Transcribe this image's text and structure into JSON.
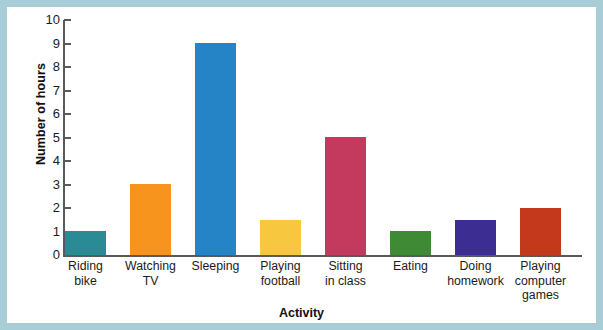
{
  "frame": {
    "border_color": "#a8cdd7",
    "background_color": "#ffffff"
  },
  "chart_data": {
    "type": "bar",
    "title": "",
    "xlabel": "Activity",
    "ylabel": "Number of hours",
    "categories": [
      "Riding\nbike",
      "Watching\nTV",
      "Sleeping",
      "Playing\nfootball",
      "Sitting\nin class",
      "Eating",
      "Doing\nhomework",
      "Playing\ncomputer\ngames"
    ],
    "values": [
      1,
      3,
      9,
      1.5,
      5,
      1,
      1.5,
      2
    ],
    "colors": [
      "#2a8b94",
      "#f7941e",
      "#2484c6",
      "#f7c73f",
      "#c43a5e",
      "#3f8a34",
      "#3b2d91",
      "#c4391c"
    ],
    "ylim": [
      0,
      10
    ],
    "ytick_labels": [
      "0",
      "1",
      "2",
      "3",
      "4",
      "5",
      "6",
      "7",
      "8",
      "9",
      "10"
    ],
    "ytick_values": [
      0,
      1,
      2,
      3,
      4,
      5,
      6,
      7,
      8,
      9,
      10
    ],
    "grid": false,
    "legend": "none",
    "axis_color": "#58595b",
    "bar_width_px": 41,
    "bar_gap_px": 24
  }
}
